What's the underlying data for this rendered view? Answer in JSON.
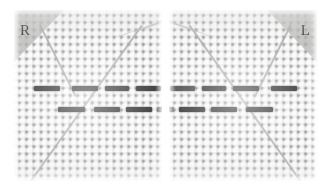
{
  "figure": {
    "background_color": "#ffffff",
    "panel_background_color": "#fafaf9",
    "grid_dot_color": "#696970",
    "band_color": "#171717",
    "line_color": "#9b9b99",
    "corner_triangle_color": "#a9a9a6"
  },
  "panels": [
    {
      "id": "panel-right",
      "label": "R",
      "label_corner": "top-left",
      "x": 14,
      "y": 10,
      "width": 148,
      "height": 171,
      "grid_pitch_px": 7.3,
      "lines": [
        {
          "name": "probe-upper-left",
          "x1": 26,
          "y1": 14,
          "x2": 62,
          "y2": 86
        },
        {
          "name": "probe-long-diagonal",
          "x1": 14,
          "y1": 174,
          "x2": 128,
          "y2": 14
        },
        {
          "name": "probe-upper-right",
          "x1": 120,
          "y1": 20,
          "x2": 148,
          "y2": 10
        }
      ],
      "band_rows": [
        {
          "name": "upper-band-row",
          "y": 76,
          "dashes": [
            {
              "x": 20,
              "width": 26
            },
            {
              "x": 58,
              "width": 26
            },
            {
              "x": 91,
              "width": 24
            },
            {
              "x": 122,
              "width": 25
            }
          ]
        },
        {
          "name": "lower-band-row",
          "y": 97,
          "dashes": [
            {
              "x": 44,
              "width": 27
            },
            {
              "x": 80,
              "width": 26
            },
            {
              "x": 112,
              "width": 26
            },
            {
              "x": 143,
              "width": 19
            }
          ]
        }
      ]
    },
    {
      "id": "panel-left",
      "label": "L",
      "label_corner": "top-right",
      "x": 169,
      "y": 10,
      "width": 148,
      "height": 171,
      "grid_pitch_px": 7.3,
      "lines": [
        {
          "name": "probe-upper-right",
          "x1": 122,
          "y1": 14,
          "x2": 86,
          "y2": 86
        },
        {
          "name": "probe-long-diagonal",
          "x1": 134,
          "y1": 174,
          "x2": 20,
          "y2": 14
        },
        {
          "name": "probe-upper-left",
          "x1": 28,
          "y1": 20,
          "x2": 0,
          "y2": 10
        }
      ],
      "band_rows": [
        {
          "name": "upper-band-row",
          "y": 76,
          "dashes": [
            {
              "x": 1,
              "width": 25
            },
            {
              "x": 33,
              "width": 24
            },
            {
              "x": 64,
              "width": 26
            },
            {
              "x": 102,
              "width": 26
            }
          ]
        },
        {
          "name": "lower-band-row",
          "y": 97,
          "dashes": [
            {
              "x": -14,
              "width": 19
            },
            {
              "x": 10,
              "width": 26
            },
            {
              "x": 42,
              "width": 26
            },
            {
              "x": 77,
              "width": 27
            }
          ]
        }
      ]
    }
  ]
}
